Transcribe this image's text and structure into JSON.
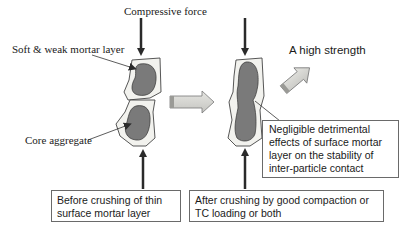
{
  "diagram": {
    "title_label": "Compressive force",
    "labels": {
      "mortar_layer": "Soft & weak mortar layer",
      "core_aggregate": "Core aggregate",
      "result": "A high strength"
    },
    "boxes": {
      "before": [
        "Before crushing of thin",
        "surface mortar layer"
      ],
      "after": [
        "After crushing by good compaction or",
        "TC loading or both"
      ],
      "negligible": [
        "Negligible detrimental",
        "effects of surface mortar",
        "layer on the stability of",
        "inter-particle contact"
      ]
    },
    "colors": {
      "aggregate_fill": "#7a7a7a",
      "mortar_fill": "#f2f2ee",
      "arrow": "#2a2a2a",
      "block_arrow_fill": "#d4d4d0",
      "box_border": "#6a6a6a"
    }
  }
}
